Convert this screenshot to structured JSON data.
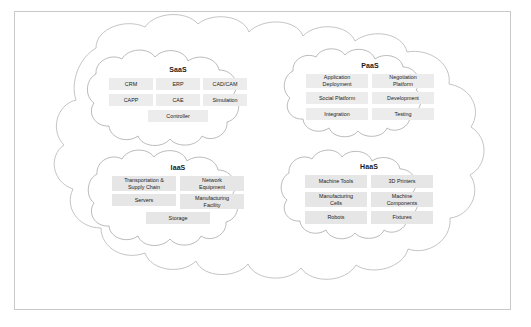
{
  "diagram": {
    "title_present": false,
    "outer_cloud_name": "manufacturing-cloud",
    "groups": [
      {
        "id": "saas",
        "label": "SaaS",
        "rows": [
          [
            "CRM",
            "ERP",
            "CAD/CAM"
          ],
          [
            "CAPP",
            "CAE",
            "Simulation"
          ],
          [
            "Controller"
          ]
        ]
      },
      {
        "id": "paas",
        "label": "PaaS",
        "rows": [
          [
            "Application\nDeployment",
            "Negotiation\nPlatform"
          ],
          [
            "Social Platform",
            "Development"
          ],
          [
            "Integration",
            "Testing"
          ]
        ]
      },
      {
        "id": "iaas",
        "label": "IaaS",
        "rows": [
          [
            "Transportation &\nSupply Chain",
            "Network\nEquipment"
          ],
          [
            "Servers",
            "Manufacturing\nFacility"
          ],
          [
            "Storage"
          ]
        ]
      },
      {
        "id": "haas",
        "label": "HaaS",
        "rows": [
          [
            "Machine Tools",
            "3D Printers"
          ],
          [
            "Manufacturing\nCells",
            "Machine\nComponents"
          ],
          [
            "Robots",
            "Fixtures"
          ]
        ]
      }
    ],
    "colors": {
      "page_background": "#ffffff",
      "frame_border": "#c9c9c9",
      "cloud_stroke": "#a8a8a8",
      "cloud_fill": "#ffffff",
      "box_fill_light": "#ececec",
      "box_fill_dark": "#e6e6e6",
      "text": "#1a1a1a"
    }
  }
}
